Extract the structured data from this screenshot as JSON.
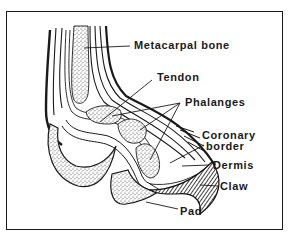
{
  "figure": {
    "labels": {
      "metacarpal": "Metacarpal bone",
      "tendon": "Tendon",
      "phalanges": "Phalanges",
      "coronary_line1": "Coronary",
      "coronary_line2": "border",
      "dermis": "Dermis",
      "claw": "Claw",
      "pad": "Pad"
    },
    "colors": {
      "ink": "#1a1a1a",
      "background": "#ffffff"
    }
  }
}
